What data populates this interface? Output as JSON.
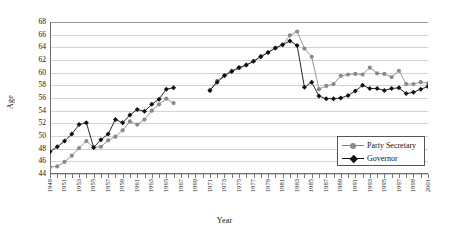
{
  "chart_data": {
    "type": "line",
    "title": "",
    "xlabel": "Year",
    "ylabel": "Age",
    "ylim": [
      44,
      68
    ],
    "ytick_step": 2,
    "yticks": [
      44,
      46,
      48,
      50,
      52,
      54,
      56,
      58,
      60,
      62,
      64,
      66,
      68
    ],
    "xlim": [
      1949,
      2001
    ],
    "grid": "horizontal",
    "legend_position": "inside-right-lower",
    "x": [
      1949,
      1950,
      1951,
      1952,
      1953,
      1954,
      1955,
      1956,
      1957,
      1958,
      1959,
      1960,
      1961,
      1962,
      1963,
      1964,
      1965,
      1966,
      1967,
      1968,
      1969,
      1970,
      1971,
      1972,
      1973,
      1974,
      1975,
      1976,
      1977,
      1978,
      1979,
      1980,
      1981,
      1982,
      1983,
      1984,
      1985,
      1986,
      1987,
      1988,
      1989,
      1990,
      1991,
      1992,
      1993,
      1994,
      1995,
      1996,
      1997,
      1998,
      1999,
      2000,
      2001
    ],
    "xtick_labels": [
      "1949",
      "1951",
      "1953",
      "1955",
      "1957",
      "1959",
      "1961",
      "1963",
      "1965",
      "1967",
      "1969",
      "1971",
      "1973",
      "1975",
      "1977",
      "1979",
      "1981",
      "1983",
      "1985",
      "1987",
      "1989",
      "1991",
      "1993",
      "1995",
      "1997",
      "1999",
      "2001"
    ],
    "series": [
      {
        "name": "Party Secretary",
        "color": "#8a8a8a",
        "marker": "circle",
        "values": [
          45.1,
          45.2,
          45.9,
          46.9,
          48.1,
          49.2,
          48.2,
          48.3,
          49.3,
          49.9,
          50.9,
          52.3,
          51.8,
          52.6,
          54.0,
          55.0,
          55.9,
          55.2,
          null,
          null,
          null,
          null,
          57.2,
          58.7,
          59.6,
          60.3,
          60.7,
          61.2,
          61.8,
          62.6,
          63.2,
          63.9,
          64.4,
          65.9,
          66.5,
          63.8,
          62.5,
          57.4,
          57.9,
          58.2,
          59.5,
          59.7,
          59.8,
          59.7,
          60.8,
          59.9,
          59.8,
          59.3,
          60.3,
          58.2,
          58.2,
          58.5,
          58.3
        ]
      },
      {
        "name": "Governor",
        "color": "#111111",
        "marker": "diamond",
        "values": [
          47.5,
          48.3,
          49.2,
          50.3,
          51.8,
          52.1,
          48.2,
          49.4,
          50.3,
          52.6,
          52.1,
          53.3,
          54.2,
          53.9,
          55.0,
          55.8,
          57.4,
          57.6,
          null,
          null,
          null,
          null,
          57.2,
          58.5,
          59.5,
          60.2,
          60.8,
          61.2,
          61.8,
          62.5,
          63.2,
          63.9,
          64.4,
          65.0,
          64.3,
          57.7,
          58.5,
          56.3,
          55.9,
          55.9,
          56.0,
          56.4,
          57.1,
          58.0,
          57.5,
          57.5,
          57.2,
          57.5,
          57.6,
          56.7,
          56.9,
          57.4,
          57.8
        ]
      }
    ]
  },
  "legend": {
    "items": [
      {
        "label": "Party Secretary"
      },
      {
        "label": "Governor"
      }
    ]
  }
}
